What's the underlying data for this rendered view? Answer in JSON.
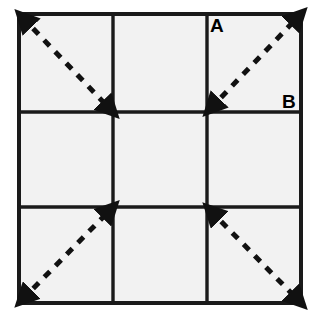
{
  "diagram": {
    "background_color": "#ffffff",
    "cell_fill_color": "#f2f2f2",
    "line_color": "#1a1a1a",
    "dash_color": "#111111",
    "grid": {
      "rows": 3,
      "columns": 3,
      "left": 19,
      "top": 14,
      "right": 301,
      "bottom": 303,
      "x_lines": [
        19,
        113,
        207,
        301
      ],
      "y_lines": [
        14,
        112,
        207,
        303
      ],
      "outer_stroke_width": 4,
      "inner_stroke_width": 3.4
    },
    "labels": [
      {
        "id": "label-a",
        "text": "A",
        "x": 210,
        "y": 32
      },
      {
        "id": "label-b",
        "text": "B",
        "x": 282,
        "y": 108
      }
    ],
    "diagonals": [
      {
        "id": "diagonal-top-left",
        "cell": "row1-col1",
        "from": {
          "x": 22,
          "y": 17
        },
        "to": {
          "x": 110,
          "y": 109
        },
        "direction": "down-right",
        "arrow_start": true,
        "arrow_end": true,
        "dash_pattern": "8 8"
      },
      {
        "id": "diagonal-top-right",
        "cell": "row1-col3",
        "from": {
          "x": 210,
          "y": 109
        },
        "to": {
          "x": 298,
          "y": 17
        },
        "direction": "up-right",
        "arrow_start": true,
        "arrow_end": true,
        "dash_pattern": "8 8"
      },
      {
        "id": "diagonal-bottom-left",
        "cell": "row3-col1",
        "from": {
          "x": 22,
          "y": 300
        },
        "to": {
          "x": 110,
          "y": 210
        },
        "direction": "up-right",
        "arrow_start": true,
        "arrow_end": true,
        "dash_pattern": "8 8"
      },
      {
        "id": "diagonal-bottom-right",
        "cell": "row3-col3",
        "from": {
          "x": 210,
          "y": 210
        },
        "to": {
          "x": 298,
          "y": 300
        },
        "direction": "down-right",
        "arrow_start": true,
        "arrow_end": true,
        "dash_pattern": "8 8"
      }
    ]
  }
}
